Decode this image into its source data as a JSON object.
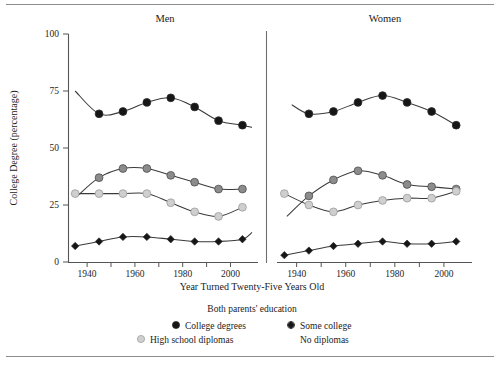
{
  "figure": {
    "y_axis_title": "College Degree (percentage)",
    "x_axis_title": "Year Turned Twenty-Five Years Old",
    "panels": [
      {
        "title": "Men"
      },
      {
        "title": "Women"
      }
    ],
    "legend": {
      "title": "Both parents' education",
      "entries": [
        {
          "label": "College degrees",
          "marker": "filled-circle-black",
          "color": "#161616"
        },
        {
          "label": "Some college",
          "marker": "filled-circle-gray",
          "color": "#8c8c8c"
        },
        {
          "label": "High school diplomas",
          "marker": "filled-circle-light",
          "color": "#cfcfcf"
        },
        {
          "label": "No diplomas",
          "marker": "filled-diamond-black",
          "color": "#161616"
        }
      ]
    }
  },
  "chart_data": {
    "type": "line",
    "xlabel": "Year Turned Twenty-Five Years Old",
    "ylabel": "College Degree (percentage)",
    "xlim": [
      1932,
      2009
    ],
    "ylim": [
      0,
      100
    ],
    "yticks": [
      0,
      25,
      50,
      75,
      100
    ],
    "xticks": [
      1940,
      1950,
      1960,
      1970,
      1980,
      1990,
      2000
    ],
    "xticklabels": [
      "1940",
      "",
      "1960",
      "",
      "1980",
      "",
      "2000"
    ],
    "grid": false,
    "legend_position": "bottom-center",
    "x": [
      1935,
      1945,
      1955,
      1965,
      1975,
      1985,
      1995,
      2005
    ],
    "panels": [
      {
        "name": "Men",
        "series": [
          {
            "name": "College degrees",
            "color": "#161616",
            "marker": "filled-circle-black",
            "x": [
              1945,
              1955,
              1965,
              1975,
              1985,
              1995,
              2005
            ],
            "values": [
              65,
              66,
              70,
              72,
              68,
              62,
              60
            ],
            "lead_in": {
              "x": 1935,
              "y": 75
            },
            "tail": {
              "x": 2009,
              "y": 59
            }
          },
          {
            "name": "Some college",
            "color": "#8c8c8c",
            "marker": "filled-circle-gray",
            "x": [
              1945,
              1955,
              1965,
              1975,
              1985,
              1995,
              2005
            ],
            "values": [
              37,
              41,
              41,
              38,
              35,
              32,
              32
            ],
            "lead_in": {
              "x": 1936,
              "y": 29
            },
            "tail": null
          },
          {
            "name": "High school diplomas",
            "color": "#cfcfcf",
            "marker": "filled-circle-light",
            "x": [
              1935,
              1945,
              1955,
              1965,
              1975,
              1985,
              1995,
              2005
            ],
            "values": [
              30,
              30,
              30,
              30,
              26,
              22,
              20,
              24
            ],
            "lead_in": null,
            "tail": null
          },
          {
            "name": "No diplomas",
            "color": "#161616",
            "marker": "filled-diamond-black",
            "x": [
              1935,
              1945,
              1955,
              1965,
              1975,
              1985,
              1995,
              2005
            ],
            "values": [
              7,
              9,
              11,
              11,
              10,
              9,
              9,
              10
            ],
            "lead_in": null,
            "tail": {
              "x": 2009,
              "y": 13
            }
          }
        ]
      },
      {
        "name": "Women",
        "series": [
          {
            "name": "College degrees",
            "color": "#161616",
            "marker": "filled-circle-black",
            "x": [
              1945,
              1955,
              1965,
              1975,
              1985,
              1995,
              2005
            ],
            "values": [
              65,
              66,
              70,
              73,
              70,
              66,
              60
            ],
            "lead_in": {
              "x": 1938,
              "y": 69
            },
            "tail": null
          },
          {
            "name": "Some college",
            "color": "#8c8c8c",
            "marker": "filled-circle-gray",
            "x": [
              1945,
              1955,
              1965,
              1975,
              1985,
              1995,
              2005
            ],
            "values": [
              29,
              36,
              40,
              38,
              34,
              33,
              32
            ],
            "lead_in": {
              "x": 1936,
              "y": 20
            },
            "tail": null
          },
          {
            "name": "High school diplomas",
            "color": "#cfcfcf",
            "marker": "filled-circle-light",
            "x": [
              1935,
              1945,
              1955,
              1965,
              1975,
              1985,
              1995,
              2005
            ],
            "values": [
              30,
              25,
              22,
              25,
              27,
              28,
              28,
              31
            ],
            "lead_in": null,
            "tail": null
          },
          {
            "name": "No diplomas",
            "color": "#161616",
            "marker": "filled-diamond-black",
            "x": [
              1935,
              1945,
              1955,
              1965,
              1975,
              1985,
              1995,
              2005
            ],
            "values": [
              3,
              5,
              7,
              8,
              9,
              8,
              8,
              9
            ],
            "lead_in": null,
            "tail": null
          }
        ]
      }
    ]
  }
}
